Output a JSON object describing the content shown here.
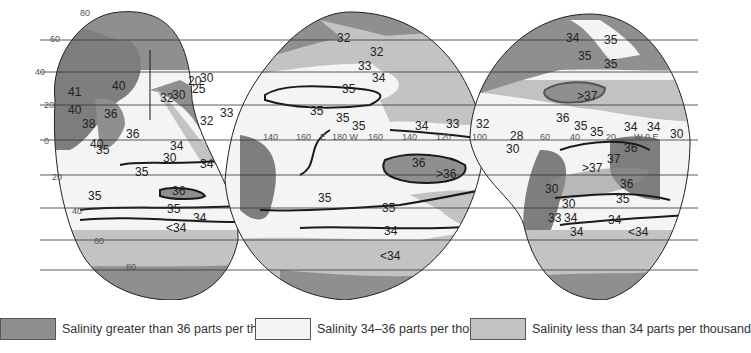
{
  "map": {
    "title": "Sea surface salinity",
    "projection": "interrupted",
    "colors": {
      "high_salinity": "#8f8f8f",
      "mid_salinity": "#f4f4f4",
      "low_salinity": "#c3c3c3",
      "land": "#7e7e7e",
      "isoline": "#1a1a1a",
      "graticule": "#333333"
    },
    "latitude_labels": [
      "80",
      "60",
      "40",
      "20",
      "0",
      "20",
      "40",
      "60",
      "80"
    ],
    "longitude_labels": [
      "140",
      "160",
      "E",
      "180 W",
      "160",
      "140",
      "120",
      "100",
      "80",
      "60",
      "40",
      "20",
      "W 0 E",
      "20"
    ],
    "isolines": {
      "indian": [
        "41",
        "40",
        "40",
        "38",
        "36",
        "36",
        "40",
        "35",
        "36",
        "34",
        "30",
        "34",
        "35",
        "35",
        "36",
        "35",
        "34",
        "<34",
        "32",
        "30",
        "25",
        "20",
        "33",
        "32",
        "30",
        "20"
      ],
      "pacific": [
        "32",
        "32",
        "33",
        "34",
        "35",
        "35",
        "35",
        "35",
        "34",
        "33",
        "36",
        ">36",
        "35",
        "35",
        "34",
        "<34"
      ],
      "atlantic": [
        "34",
        "35",
        "35",
        "35",
        ">37",
        "36",
        "35",
        "35",
        "34",
        "34",
        "30",
        "32",
        "28",
        "30",
        "36",
        "37",
        ">37",
        "36",
        "35",
        "30",
        "30",
        "33",
        "34",
        "34",
        "34",
        "<34"
      ]
    }
  },
  "legend": {
    "items": [
      {
        "label": "Salinity greater than 36 parts per thousand",
        "color": "#8f8f8f"
      },
      {
        "label": "Salinity 34–36 parts per thousand",
        "color": "#f4f4f4"
      },
      {
        "label": "Salinity less than 34 parts per thousand",
        "color": "#c3c3c3"
      }
    ]
  }
}
